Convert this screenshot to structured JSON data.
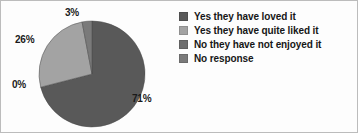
{
  "chart_data": {
    "type": "pie",
    "title": "",
    "subtitle": "",
    "xlabel": "",
    "ylabel": "",
    "grid": false,
    "legend_position": "right",
    "start_angle_deg": 0,
    "direction": "clockwise",
    "categories": [
      "Yes they have loved it",
      "Yes they have quite liked it",
      "No they have not enjoyed it",
      "No response"
    ],
    "values": [
      71,
      26,
      0,
      3
    ],
    "data_labels": [
      "71%",
      "26%",
      "0%",
      "3%"
    ],
    "colors": [
      "#595959",
      "#a3a3a3",
      "#6e6e6e",
      "#7a7a7a"
    ],
    "slices": [
      {
        "label": "Yes they have loved it",
        "value": 71,
        "data_label": "71%",
        "color": "#595959"
      },
      {
        "label": "Yes they have quite liked it",
        "value": 26,
        "data_label": "26%",
        "color": "#a3a3a3"
      },
      {
        "label": "No they have not enjoyed it",
        "value": 0,
        "data_label": "0%",
        "color": "#6e6e6e"
      },
      {
        "label": "No response",
        "value": 3,
        "data_label": "3%",
        "color": "#7a7a7a"
      }
    ]
  },
  "legend": {
    "items": [
      {
        "label": "Yes they have loved it",
        "color": "#595959",
        "swatch": "legend-swatch-square"
      },
      {
        "label": "Yes they have quite liked it",
        "color": "#a3a3a3",
        "swatch": "legend-swatch-square"
      },
      {
        "label": "No they have not enjoyed it",
        "color": "#6e6e6e",
        "swatch": "legend-swatch-square"
      },
      {
        "label": "No response",
        "color": "#7a7a7a",
        "swatch": "legend-swatch-square"
      }
    ]
  },
  "labels": {
    "top": "3%",
    "upper_left": "26%",
    "lower_left": "0%",
    "right": "71%"
  }
}
